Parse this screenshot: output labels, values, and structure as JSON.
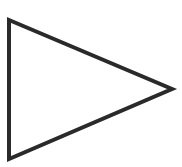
{
  "shape": {
    "type": "triangle",
    "orientation": "right",
    "points": [
      [
        9,
        20
      ],
      [
        172,
        89
      ],
      [
        9,
        159
      ]
    ],
    "stroke_color": "#2a2a2a",
    "fill_color": "#ffffff",
    "stroke_width": 4
  }
}
